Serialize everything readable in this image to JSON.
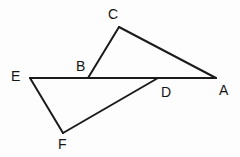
{
  "figure": {
    "background_color": "#fdfdfd",
    "stroke_color": "#1b1b1b",
    "label_color": "#141414",
    "stroke_width": 2,
    "canvas": {
      "width": 240,
      "height": 157
    }
  },
  "chart_data": {
    "type": "diagram",
    "subtype": "line-figure",
    "xlabel": "",
    "ylabel": "",
    "xlim": [
      0,
      240
    ],
    "ylim": [
      0,
      157
    ],
    "grid": false,
    "legend": "none",
    "points": [
      {
        "name": "A",
        "x": 216,
        "y": 78,
        "label": "A",
        "label_x": 219,
        "label_y": 83
      },
      {
        "name": "B",
        "x": 88,
        "y": 78,
        "label": "B",
        "label_x": 76,
        "label_y": 59
      },
      {
        "name": "C",
        "x": 119,
        "y": 27,
        "label": "C",
        "label_x": 108,
        "label_y": 7
      },
      {
        "name": "D",
        "x": 158,
        "y": 78,
        "label": "D",
        "label_x": 161,
        "label_y": 85
      },
      {
        "name": "E",
        "x": 30,
        "y": 78,
        "label": "E",
        "label_x": 11,
        "label_y": 69
      },
      {
        "name": "F",
        "x": 63,
        "y": 133,
        "label": "F",
        "label_x": 58,
        "label_y": 137
      }
    ],
    "segments": [
      {
        "name": "segment-EA",
        "from": "E",
        "to": "A",
        "x1": 30,
        "y1": 78,
        "x2": 216,
        "y2": 78
      },
      {
        "name": "segment-BC",
        "from": "B",
        "to": "C",
        "x1": 88,
        "y1": 78,
        "x2": 119,
        "y2": 27
      },
      {
        "name": "segment-CA",
        "from": "C",
        "to": "A",
        "x1": 119,
        "y1": 27,
        "x2": 216,
        "y2": 78
      },
      {
        "name": "segment-EF",
        "from": "E",
        "to": "F",
        "x1": 30,
        "y1": 78,
        "x2": 63,
        "y2": 133
      },
      {
        "name": "segment-FD",
        "from": "F",
        "to": "D",
        "x1": 63,
        "y1": 133,
        "x2": 158,
        "y2": 78
      }
    ],
    "labels": [
      "C",
      "B",
      "E",
      "A",
      "D",
      "F"
    ]
  }
}
